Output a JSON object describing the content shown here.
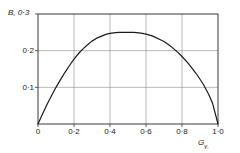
{
  "chart_data": {
    "type": "line",
    "title": "",
    "subtitle": "",
    "ylabel": "B,",
    "xlabel": "G",
    "xlabel_sub": "γ,",
    "xlabel_full": "Gγ,",
    "xtick_labels": [
      "0",
      "0·2",
      "0·4",
      "0·6",
      "0·8",
      "1·0"
    ],
    "xtick_values": [
      0,
      0.2,
      0.4,
      0.6,
      0.8,
      1.0
    ],
    "ytick_labels": [
      "0·3",
      "0·2",
      "0·1"
    ],
    "ytick_values": [
      0.3,
      0.2,
      0.1
    ],
    "xlim": [
      0,
      1.0
    ],
    "ylim": [
      0,
      0.3
    ],
    "grid": true,
    "legend": "none",
    "line_color": "#1a1a1a",
    "axis_color": "#4a4a4a",
    "grid_color": "#9a9a9a",
    "series": [
      {
        "name": "B",
        "x": [
          0.0,
          0.02,
          0.05,
          0.08,
          0.1,
          0.13,
          0.15,
          0.18,
          0.2,
          0.23,
          0.25,
          0.28,
          0.3,
          0.33,
          0.35,
          0.38,
          0.4,
          0.43,
          0.45,
          0.48,
          0.5,
          0.53,
          0.55,
          0.58,
          0.6,
          0.63,
          0.65,
          0.68,
          0.7,
          0.73,
          0.75,
          0.78,
          0.8,
          0.83,
          0.85,
          0.88,
          0.9,
          0.92,
          0.95,
          0.97,
          1.0
        ],
        "y": [
          0.0,
          0.022,
          0.053,
          0.082,
          0.1,
          0.125,
          0.141,
          0.163,
          0.177,
          0.195,
          0.205,
          0.218,
          0.226,
          0.235,
          0.239,
          0.245,
          0.247,
          0.249,
          0.25,
          0.25,
          0.25,
          0.25,
          0.249,
          0.247,
          0.245,
          0.241,
          0.237,
          0.23,
          0.225,
          0.215,
          0.207,
          0.194,
          0.184,
          0.168,
          0.156,
          0.137,
          0.122,
          0.107,
          0.079,
          0.056,
          0.0
        ]
      }
    ]
  }
}
